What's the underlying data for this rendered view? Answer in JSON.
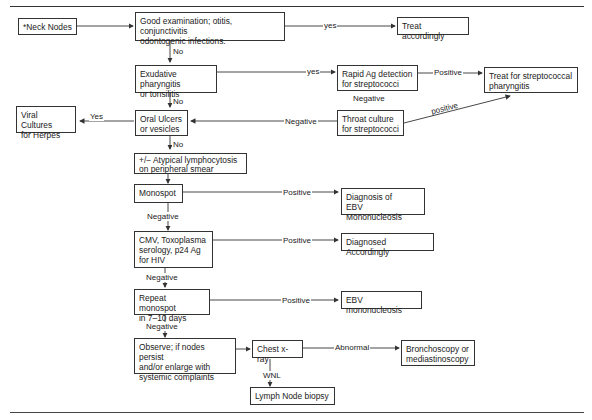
{
  "header_fragment": "",
  "nodes": {
    "neck_nodes": "*Neck Nodes",
    "good_exam": "Good examination; otitis, conjunctivitis\nodontogenic infections.",
    "treat_accordingly": "Treat accordingly",
    "exudative": "Exudative pharyngitis\nor tonsilitis",
    "rapid_ag": "Rapid Ag detection\nfor streptococci",
    "treat_strep": "Treat for streptococcal\npharyngitis",
    "viral_cultures": "Viral Cultures\nfor Herpes",
    "oral_ulcers": "Oral Ulcers\nor vesicles",
    "throat_culture": "Throat culture\nfor streptococci",
    "atypical": "+/− Atypical lymphocytosis\non peripheral smear",
    "monospot": "Monospot",
    "dx_ebv": "Diagnosis of\nEBV Mononucleosis",
    "cmv": "CMV, Toxoplasma\nserology, p24 Ag\nfor HIV",
    "dx_accordingly": "Diagnosed Accordingly",
    "repeat_monospot": "Repeat monospot\nin 7–10 days",
    "ebv_mono": "EBV mononucleosis",
    "observe": "Observe; if nodes persist\nand/or enlarge with\nsystemic complaints",
    "chest_xray": "Chest x-ray",
    "broncho": "Bronchoscopy or\nmediastinoscopy",
    "biopsy": "Lymph Node biopsy"
  },
  "labels": {
    "yes1": "yes",
    "no1": "No",
    "yes2": "yes",
    "positive1": "Positive",
    "negative_rapid": "Negative",
    "no2": "No",
    "yes_herpes": "Yes",
    "negative_throat": "Negative",
    "positive_throat": "positive",
    "positive_mono": "Positive",
    "negative_mono": "Negative",
    "positive_cmv": "Positive",
    "negative_cmv": "Negative",
    "positive_repeat": "Positive",
    "negative_repeat": "Negative",
    "abnormal": "Abnormal",
    "wnl": "WNL"
  }
}
